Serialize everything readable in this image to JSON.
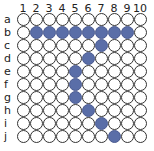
{
  "plate": {
    "columns": [
      "1",
      "2",
      "3",
      "4",
      "5",
      "6",
      "7",
      "8",
      "9",
      "10"
    ],
    "rows": [
      "a",
      "b",
      "c",
      "d",
      "e",
      "f",
      "g",
      "h",
      "i",
      "j"
    ],
    "fill_color": "#5a6ea8",
    "empty_color": "#ffffff",
    "filled_wells": [
      "b2",
      "b3",
      "b4",
      "b5",
      "b6",
      "b7",
      "b8",
      "b9",
      "c7",
      "d6",
      "e5",
      "f5",
      "g5",
      "h6",
      "i7",
      "j8"
    ]
  }
}
